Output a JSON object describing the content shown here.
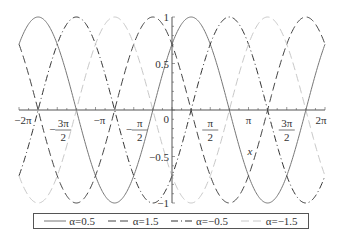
{
  "chart_data": {
    "type": "line",
    "title": "",
    "xlabel": "x",
    "ylabel": "",
    "xlim": [
      -6.2832,
      6.2832
    ],
    "ylim": [
      -1,
      1
    ],
    "x_ticks": [
      "-2π",
      "-3π/2",
      "-π",
      "-π/2",
      "0",
      "π/2",
      "π",
      "3π/2",
      "2π"
    ],
    "y_ticks": [
      "-1",
      "-0.5",
      "0",
      "0.5",
      "1"
    ],
    "grid": false,
    "legend_position": "bottom",
    "function": "sin(x + α·π/2)",
    "series": [
      {
        "name": "α=0.5",
        "alpha": 0.5,
        "style": "solid",
        "color": "#777777"
      },
      {
        "name": "α=1.5",
        "alpha": 1.5,
        "style": "dash",
        "color": "#444444"
      },
      {
        "name": "α=-0.5",
        "alpha": -0.5,
        "style": "dashdot",
        "color": "#333333"
      },
      {
        "name": "α=-1.5",
        "alpha": -1.5,
        "style": "dash",
        "color": "#c8c8c8"
      }
    ]
  },
  "legend": {
    "items": [
      "α=0.5",
      "α=1.5",
      "α=−0.5",
      "α=−1.5"
    ]
  },
  "axes": {
    "xlabel": "x"
  }
}
